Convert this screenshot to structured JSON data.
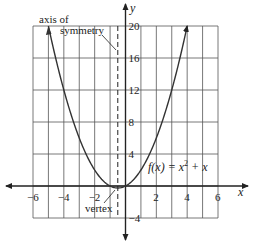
{
  "chart_data": {
    "type": "line",
    "title": "",
    "function_label": "f(x) = x² + x",
    "xlabel": "x",
    "ylabel": "y",
    "xlim": [
      -6,
      6
    ],
    "ylim": [
      -4,
      20
    ],
    "x_ticks": [
      -6,
      -4,
      -2,
      2,
      4,
      6
    ],
    "y_ticks": [
      20,
      16,
      12,
      8,
      4,
      -4
    ],
    "grid": true,
    "axis_of_symmetry": -0.5,
    "vertex": [
      -0.5,
      -0.25
    ],
    "series": [
      {
        "name": "f(x) = x^2 + x",
        "x": [
          -5,
          -4.5,
          -4,
          -3.5,
          -3,
          -2.5,
          -2,
          -1.5,
          -1,
          -0.5,
          0,
          0.5,
          1,
          1.5,
          2,
          2.5,
          3,
          3.5,
          4
        ],
        "values": [
          20,
          15.75,
          12,
          8.75,
          6,
          3.75,
          2,
          0.75,
          0,
          -0.25,
          0,
          0.75,
          2,
          3.75,
          6,
          8.75,
          12,
          15.75,
          20
        ]
      }
    ],
    "annotations": [
      {
        "text": "axis of",
        "line2": "symmetry",
        "points_to": "dashed line x = -0.5"
      },
      {
        "text": "vertex",
        "points_to": [
          -0.5,
          -0.25
        ]
      }
    ]
  },
  "labels": {
    "axis_line1": "axis of",
    "axis_line2": "symmetry",
    "vertex": "vertex",
    "x": "x",
    "y": "y",
    "func_pre": "f(x) = x",
    "func_exp": "2",
    "func_post": " + x",
    "xt": [
      "−6",
      "−4",
      "−2",
      "2",
      "4",
      "6"
    ],
    "yt": [
      "20",
      "16",
      "12",
      "8",
      "4",
      "−4"
    ]
  }
}
